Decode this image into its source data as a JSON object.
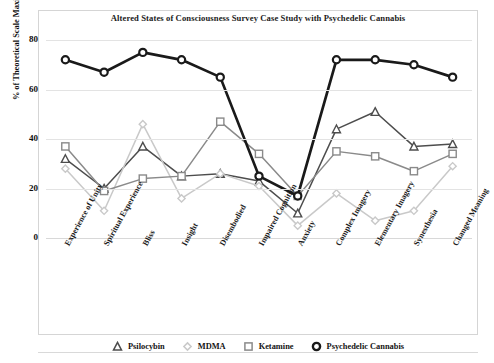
{
  "chart": {
    "title": "Altered States of Consciousness Survey Case Study with Psychedelic Cannabis",
    "ylabel": "% of Theoretical Scale Maximum"
  },
  "chart_data": {
    "type": "line",
    "title": "Altered States of Consciousness Survey Case Study with Psychedelic Cannabis",
    "xlabel": "",
    "ylabel": "% of Theoretical Scale Maximum",
    "ylim": [
      0,
      80
    ],
    "yticks": [
      0,
      20,
      40,
      60,
      80
    ],
    "grid": true,
    "legend_position": "bottom",
    "categories": [
      "Experience of Unity",
      "Spiritual Experience",
      "Bliss",
      "Insight",
      "Disembodied",
      "Impaired Cognition",
      "Anxiety",
      "Complex Imagery",
      "Elementary Imagery",
      "Synesthesia",
      "Changed Meaning"
    ],
    "series": [
      {
        "name": "Psilocybin",
        "marker": "triangle",
        "color": "#4d4d4d",
        "values": [
          32,
          20,
          37,
          25,
          26,
          23,
          10,
          44,
          51,
          37,
          38
        ]
      },
      {
        "name": "MDMA",
        "marker": "diamond",
        "color": "#c9c9c9",
        "values": [
          28,
          11,
          46,
          16,
          26,
          21,
          5,
          18,
          7,
          11,
          29
        ]
      },
      {
        "name": "Ketamine",
        "marker": "square",
        "color": "#8a8a8a",
        "values": [
          37,
          19,
          24,
          25,
          47,
          34,
          17,
          35,
          33,
          27,
          34
        ]
      },
      {
        "name": "Psychedelic Cannabis",
        "marker": "circle",
        "color": "#1a1a1a",
        "values": [
          72,
          67,
          75,
          72,
          65,
          25,
          17,
          72,
          72,
          70,
          65
        ]
      }
    ]
  },
  "legend": {
    "items": [
      {
        "label": "Psilocybin",
        "marker": "triangle-marker",
        "color": "#4d4d4d"
      },
      {
        "label": "MDMA",
        "marker": "diamond-marker",
        "color": "#c9c9c9"
      },
      {
        "label": "Ketamine",
        "marker": "square-marker",
        "color": "#8a8a8a"
      },
      {
        "label": "Psychedelic Cannabis",
        "marker": "circle-marker",
        "color": "#1a1a1a"
      }
    ]
  }
}
